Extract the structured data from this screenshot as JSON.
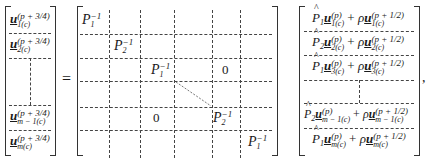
{
  "equation": {
    "lhs": {
      "label": "left vector",
      "rows": [
        {
          "base": "u",
          "sup": "(p + 3/4)",
          "sub": "1(c)"
        },
        {
          "base": "u",
          "sup": "(p + 3/4)",
          "sub": "2(c)"
        },
        {
          "base": "u",
          "sup": "(p + 3/4)",
          "sub": "m − 1(c)"
        },
        {
          "base": "u",
          "sup": "(p + 3/4)",
          "sub": "m(c)"
        }
      ]
    },
    "equals": "=",
    "matrix": {
      "label": "block tridiagonal inverse matrix",
      "entries": [
        {
          "base": "P",
          "sub": "1",
          "sup": "−1"
        },
        {
          "base": "P",
          "sub": "2",
          "sup": "−1"
        },
        {
          "base": "P",
          "sub": "1",
          "sup": "−1"
        },
        {
          "base": "P",
          "sub": "2",
          "sup": "−1"
        },
        {
          "base": "P",
          "sub": "1",
          "sup": "−1"
        }
      ],
      "zeros": [
        "0",
        "0"
      ]
    },
    "rhs": {
      "label": "right vector",
      "rows": [
        {
          "P": "P",
          "Psub": "1",
          "u1sup": "(p)",
          "u1sub": "1(c)",
          "rho": "ρ",
          "u2sup": "(p + 1/2)",
          "u2sub": "1(c)"
        },
        {
          "P": "P",
          "Psub": "2",
          "u1sup": "(p)",
          "u1sub": "2(c)",
          "rho": "ρ",
          "u2sup": "(p + 1/2)",
          "u2sub": "2(c)"
        },
        {
          "P": "P",
          "Psub": "1",
          "u1sup": "(p)",
          "u1sub": "3(c)",
          "rho": "ρ",
          "u2sup": "(p + 1/2)",
          "u2sub": "3(c)"
        },
        {
          "P": "P",
          "Psub": "2",
          "u1sup": "(p)",
          "u1sub": "m − 1(c)",
          "rho": "ρ",
          "u2sup": "(p + 1/2)",
          "u2sub": "m − 1(c)"
        },
        {
          "P": "P",
          "Psub": "1",
          "u1sup": "(p)",
          "u1sub": "m(c)",
          "rho": "ρ",
          "u2sup": "(p + 1/2)",
          "u2sub": "m(c)"
        }
      ],
      "plus": "+"
    },
    "trailing": ","
  }
}
